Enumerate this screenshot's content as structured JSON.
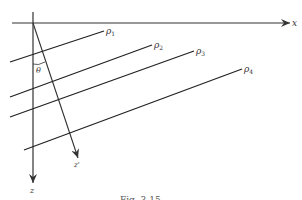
{
  "figure": {
    "axes": {
      "x_label": "x",
      "z_label": "z",
      "z_prime_label": "z'",
      "angle_label": "θ"
    },
    "planes": [
      {
        "label": "ρ",
        "sub": "1"
      },
      {
        "label": "ρ",
        "sub": "2"
      },
      {
        "label": "ρ",
        "sub": "3"
      },
      {
        "label": "ρ",
        "sub": "4"
      }
    ],
    "caption": "Fig. 3.15"
  }
}
